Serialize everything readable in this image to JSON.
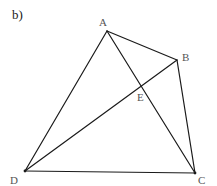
{
  "figure": {
    "part_label": "b)"
  },
  "points": {
    "A": {
      "label": "A",
      "x": 107,
      "y": 31,
      "label_x": 99,
      "label_y": 26
    },
    "B": {
      "label": "B",
      "x": 177,
      "y": 60,
      "label_x": 182,
      "label_y": 61
    },
    "C": {
      "label": "C",
      "x": 195,
      "y": 173,
      "label_x": 198,
      "label_y": 184
    },
    "D": {
      "label": "D",
      "x": 25,
      "y": 171,
      "label_x": 10,
      "label_y": 184
    },
    "E": {
      "label": "E",
      "x": 141,
      "y": 86,
      "label_x": 137,
      "label_y": 101
    }
  },
  "segments": [
    {
      "name": "AB",
      "from": "A",
      "to": "B"
    },
    {
      "name": "BC",
      "from": "B",
      "to": "C"
    },
    {
      "name": "CD",
      "from": "C",
      "to": "D"
    },
    {
      "name": "DA",
      "from": "D",
      "to": "A"
    },
    {
      "name": "AC",
      "from": "A",
      "to": "C"
    },
    {
      "name": "BD",
      "from": "B",
      "to": "D"
    }
  ],
  "colors": {
    "line": "#1a1a1a",
    "label": "#555555",
    "background": "#ffffff"
  }
}
